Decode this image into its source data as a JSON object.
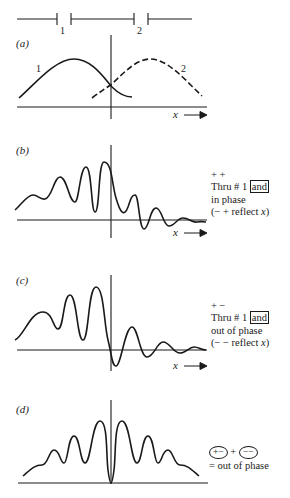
{
  "slits": {
    "label_1": "1",
    "label_2": "2"
  },
  "panels": [
    {
      "id": "a",
      "label": "(a)",
      "curve_1_label": "1",
      "curve_2_label": "2",
      "x_axis_label": "x"
    },
    {
      "id": "b",
      "label": "(b)",
      "x_axis_label": "x",
      "note": {
        "line1": "+ +",
        "line2_prefix": "Thru # 1",
        "line2_boxed": "and",
        "line3": "in phase",
        "line4_prefix": "(− + reflect ",
        "line4_var": "x",
        "line4_suffix": ")"
      }
    },
    {
      "id": "c",
      "label": "(c)",
      "x_axis_label": "x",
      "note": {
        "line1": "+ −",
        "line2_prefix": "Thru # 1",
        "line2_boxed": "and",
        "line3": "out of phase",
        "line4_prefix": "(− − reflect ",
        "line4_var": "x",
        "line4_suffix": ")"
      }
    },
    {
      "id": "d",
      "label": "(d)",
      "note": {
        "oval1": "+−",
        "plus": "+",
        "oval2": "−−",
        "line2": "= out of phase"
      }
    }
  ],
  "colors": {
    "ink": "#1a1a1a",
    "background": "#ffffff"
  }
}
